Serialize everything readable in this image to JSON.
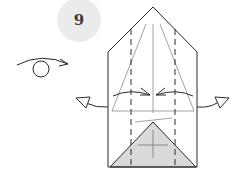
{
  "step": {
    "number": "9"
  },
  "colors": {
    "line": "#2a2a2a",
    "thin_line": "#8a8a8a",
    "badge_bg": "#ebebeb",
    "shaded_triangle": "#d9d9d9"
  },
  "symbols": {
    "turn_over": "turn-over-arrow-icon",
    "pull_out_left": "hollow-arrow-left-icon",
    "pull_out_right": "hollow-arrow-right-icon",
    "fold_in_arrows": "fold-in-arrows-icon"
  }
}
